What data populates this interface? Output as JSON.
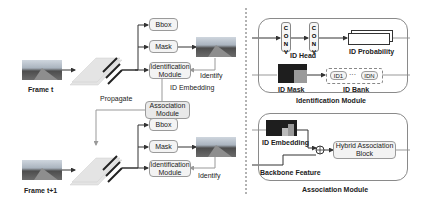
{
  "left": {
    "frame_t": "Frame t",
    "frame_t1": "Frame t+1",
    "top": {
      "bbox": "Bbox",
      "mask": "Mask",
      "identification_module": "Identification Module",
      "identify": "Identify"
    },
    "id_embedding": "ID Embedding",
    "propagate": "Propagate",
    "association_module": "Association Module",
    "bottom": {
      "bbox": "Bbox",
      "mask": "Mask",
      "identification_module": "Identification Module",
      "identify": "Identify"
    }
  },
  "identification_panel": {
    "conv1": "C O N V",
    "conv2": "C O N V",
    "id_head": "ID Head",
    "id_probability": "ID Probability",
    "id_mask": "ID Mask",
    "id_bank": "ID Bank",
    "id1": "ID1",
    "dots": "···",
    "idn": "IDN",
    "title": "Identification Module"
  },
  "association_panel": {
    "id_embedding": "ID Embedding",
    "backbone_feature": "Backbone Feature",
    "hybrid_block": "Hybrid Association Block",
    "plus": "+",
    "title": "Association Module"
  },
  "colors": {
    "box_fill": "#f3f3f3",
    "box_border": "#9a9a9a",
    "arrow": "#333333",
    "mask_dark": "#1e1e1e",
    "mask_light": "#9a9a9a"
  }
}
